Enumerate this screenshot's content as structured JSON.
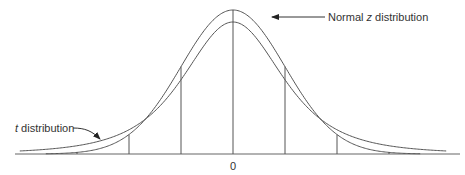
{
  "diagram": {
    "title": "",
    "labels": {
      "normal": "Normal z distribution",
      "normal_italic_letter": "z",
      "t": "t distribution",
      "center": "0"
    },
    "series": [
      {
        "name": "Normal z distribution",
        "type": "normal"
      },
      {
        "name": "t distribution",
        "type": "t"
      }
    ],
    "vertical_markers_sd": [
      -3,
      -2,
      -1,
      0,
      1,
      2,
      3
    ],
    "colors": {
      "line": "#555555",
      "text": "#333333"
    }
  }
}
